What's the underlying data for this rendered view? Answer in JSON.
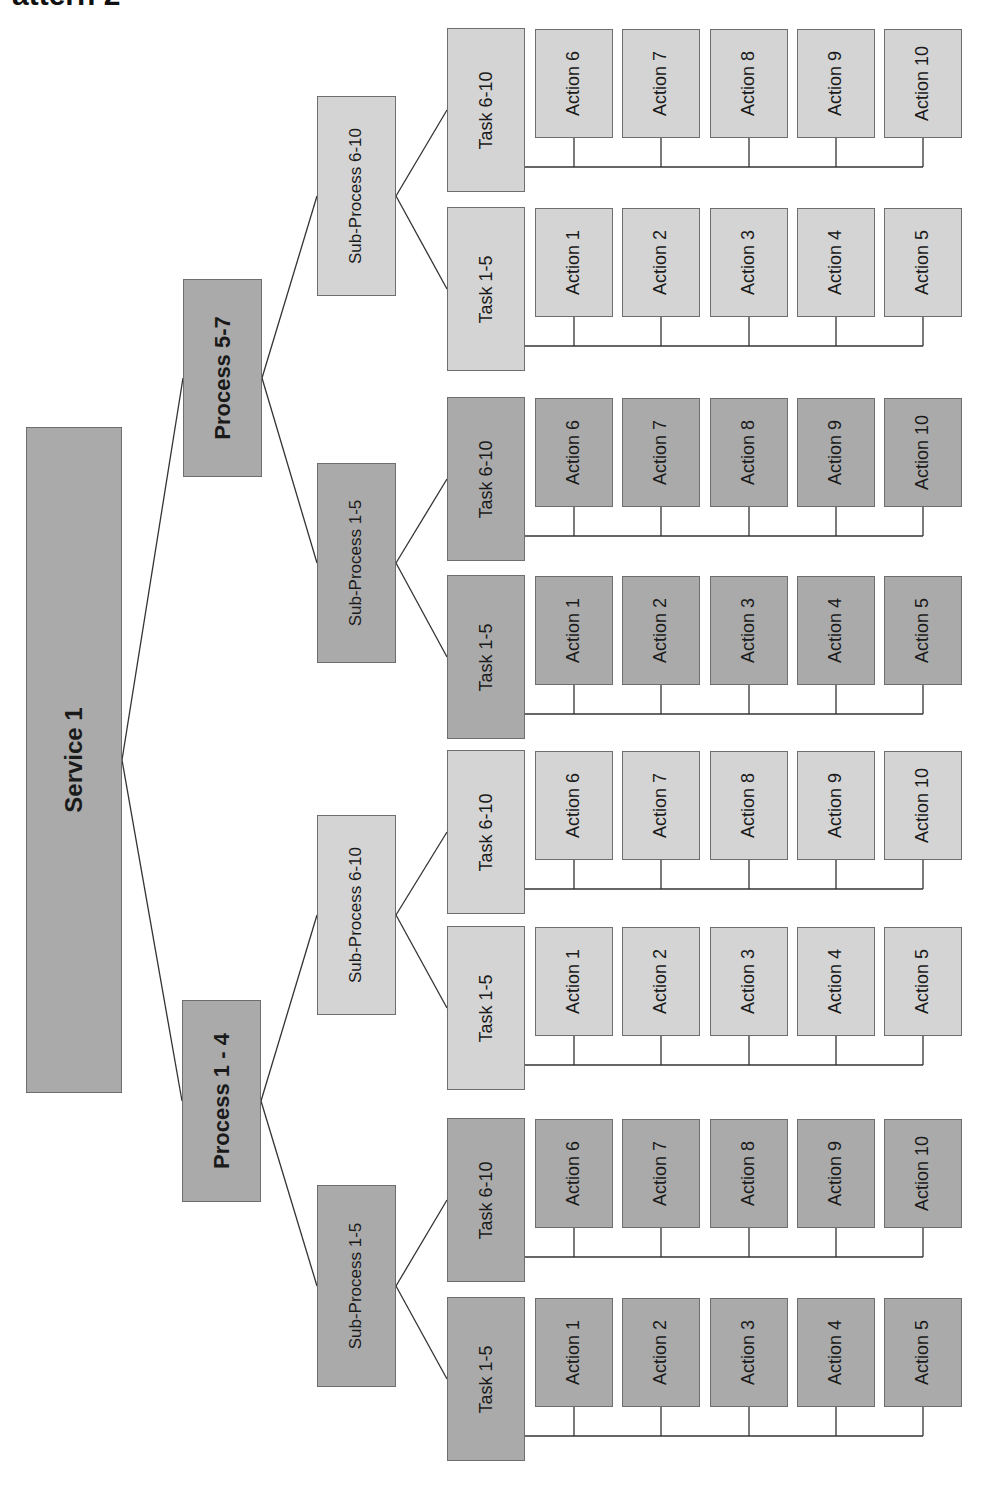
{
  "title": "Pattern 2",
  "colors": {
    "dark_fill": "#b4b4b4",
    "light_fill": "#dedede",
    "border": "#6e6e6e",
    "line": "#333333"
  },
  "service": {
    "label": "Service 1",
    "shade": "dark",
    "x": 26,
    "y": 427,
    "w": 96,
    "h": 666
  },
  "processes": [
    {
      "label": "Process 5-7",
      "shade": "dark",
      "x": 183,
      "y": 279,
      "w": 79,
      "h": 198
    },
    {
      "label": "Process 1 - 4",
      "shade": "dark",
      "x": 182,
      "y": 1000,
      "w": 79,
      "h": 202
    }
  ],
  "sub_processes": [
    {
      "label": "Sub-Process 6-10",
      "shade": "light",
      "parent": 0,
      "x": 317,
      "y": 96,
      "w": 79,
      "h": 200
    },
    {
      "label": "Sub-Process 1-5",
      "shade": "dark",
      "parent": 0,
      "x": 317,
      "y": 463,
      "w": 79,
      "h": 200
    },
    {
      "label": "Sub-Process 6-10",
      "shade": "light",
      "parent": 1,
      "x": 317,
      "y": 815,
      "w": 79,
      "h": 200
    },
    {
      "label": "Sub-Process 1-5",
      "shade": "dark",
      "parent": 1,
      "x": 317,
      "y": 1185,
      "w": 79,
      "h": 202
    }
  ],
  "tasks": [
    {
      "label": "Task 6-10",
      "shade": "light",
      "parent": 0,
      "y": 28,
      "actions": [
        "Action 6",
        "Action 7",
        "Action 8",
        "Action 9",
        "Action 10"
      ]
    },
    {
      "label": "Task 1-5",
      "shade": "light",
      "parent": 0,
      "y": 207,
      "actions": [
        "Action 1",
        "Action 2",
        "Action 3",
        "Action 4",
        "Action 5"
      ]
    },
    {
      "label": "Task 6-10",
      "shade": "dark",
      "parent": 1,
      "y": 397,
      "actions": [
        "Action 6",
        "Action 7",
        "Action 8",
        "Action 9",
        "Action 10"
      ]
    },
    {
      "label": "Task 1-5",
      "shade": "dark",
      "parent": 1,
      "y": 575,
      "actions": [
        "Action 1",
        "Action 2",
        "Action 3",
        "Action 4",
        "Action 5"
      ]
    },
    {
      "label": "Task 6-10",
      "shade": "light",
      "parent": 2,
      "y": 750,
      "actions": [
        "Action 6",
        "Action 7",
        "Action 8",
        "Action 9",
        "Action 10"
      ]
    },
    {
      "label": "Task 1-5",
      "shade": "light",
      "parent": 2,
      "y": 926,
      "actions": [
        "Action 1",
        "Action 2",
        "Action 3",
        "Action 4",
        "Action 5"
      ]
    },
    {
      "label": "Task 6-10",
      "shade": "dark",
      "parent": 3,
      "y": 1118,
      "actions": [
        "Action 6",
        "Action 7",
        "Action 8",
        "Action 9",
        "Action 10"
      ]
    },
    {
      "label": "Task 1-5",
      "shade": "dark",
      "parent": 3,
      "y": 1297,
      "actions": [
        "Action 1",
        "Action 2",
        "Action 3",
        "Action 4",
        "Action 5"
      ]
    }
  ],
  "layout": {
    "task_x": 447,
    "task_w": 78,
    "task_h": 164,
    "action_xs": [
      535,
      622,
      710,
      797,
      884
    ],
    "action_w": 78,
    "action_h": 109,
    "bus_offset": 139
  }
}
